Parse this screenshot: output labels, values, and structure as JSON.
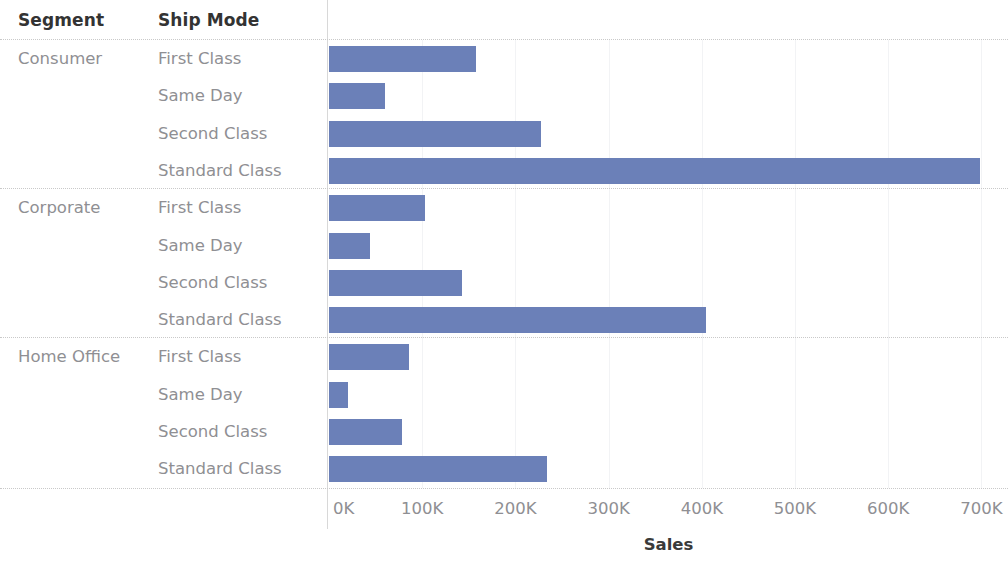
{
  "header": {
    "segment_label": "Segment",
    "shipmode_label": "Ship Mode"
  },
  "axis": {
    "title": "Sales",
    "ticks": [
      "0K",
      "100K",
      "200K",
      "300K",
      "400K",
      "500K",
      "600K",
      "700K"
    ]
  },
  "colors": {
    "bar": "#6b80b8",
    "grid": "#f2f3f5",
    "separator": "#d8d8d8",
    "header_text": "#333333",
    "label_text": "#8f8f93"
  },
  "rows": [
    {
      "segment": "Consumer",
      "ship_mode": "First Class",
      "value": 158000
    },
    {
      "segment": "",
      "ship_mode": "Same Day",
      "value": 60000
    },
    {
      "segment": "",
      "ship_mode": "Second Class",
      "value": 227000
    },
    {
      "segment": "",
      "ship_mode": "Standard Class",
      "value": 699000
    },
    {
      "segment": "Corporate",
      "ship_mode": "First Class",
      "value": 103000
    },
    {
      "segment": "",
      "ship_mode": "Same Day",
      "value": 44000
    },
    {
      "segment": "",
      "ship_mode": "Second Class",
      "value": 143000
    },
    {
      "segment": "",
      "ship_mode": "Standard Class",
      "value": 404000
    },
    {
      "segment": "Home Office",
      "ship_mode": "First Class",
      "value": 86000
    },
    {
      "segment": "",
      "ship_mode": "Same Day",
      "value": 20000
    },
    {
      "segment": "",
      "ship_mode": "Second Class",
      "value": 78000
    },
    {
      "segment": "",
      "ship_mode": "Standard Class",
      "value": 234000
    }
  ],
  "chart_data": {
    "type": "bar",
    "orientation": "horizontal",
    "title": "",
    "xlabel": "Sales",
    "ylabel": "",
    "xlim": [
      0,
      730000
    ],
    "xticks": [
      0,
      100000,
      200000,
      300000,
      400000,
      500000,
      600000,
      700000
    ],
    "xticklabels": [
      "0K",
      "100K",
      "200K",
      "300K",
      "400K",
      "500K",
      "600K",
      "700K"
    ],
    "grid": true,
    "legend": false,
    "group_labels": [
      "Segment",
      "Ship Mode"
    ],
    "groups": [
      {
        "segment": "Consumer",
        "categories": [
          "First Class",
          "Same Day",
          "Second Class",
          "Standard Class"
        ],
        "values": [
          158000,
          60000,
          227000,
          699000
        ]
      },
      {
        "segment": "Corporate",
        "categories": [
          "First Class",
          "Same Day",
          "Second Class",
          "Standard Class"
        ],
        "values": [
          103000,
          44000,
          143000,
          404000
        ]
      },
      {
        "segment": "Home Office",
        "categories": [
          "First Class",
          "Same Day",
          "Second Class",
          "Standard Class"
        ],
        "values": [
          86000,
          20000,
          78000,
          234000
        ]
      }
    ],
    "categories": [
      "Consumer / First Class",
      "Consumer / Same Day",
      "Consumer / Second Class",
      "Consumer / Standard Class",
      "Corporate / First Class",
      "Corporate / Same Day",
      "Corporate / Second Class",
      "Corporate / Standard Class",
      "Home Office / First Class",
      "Home Office / Same Day",
      "Home Office / Second Class",
      "Home Office / Standard Class"
    ],
    "values": [
      158000,
      60000,
      227000,
      699000,
      103000,
      44000,
      143000,
      404000,
      86000,
      20000,
      78000,
      234000
    ],
    "color": "#6b80b8"
  }
}
